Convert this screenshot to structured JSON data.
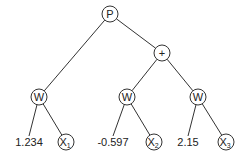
{
  "diagram": {
    "type": "expression-tree",
    "nodes": [
      {
        "id": "p",
        "label": "P",
        "sub": "",
        "x": 110,
        "y": 14
      },
      {
        "id": "plus",
        "label": "+",
        "sub": "",
        "x": 162,
        "y": 53
      },
      {
        "id": "w1",
        "label": "W",
        "sub": "",
        "x": 39,
        "y": 97
      },
      {
        "id": "w2",
        "label": "W",
        "sub": "",
        "x": 127,
        "y": 97
      },
      {
        "id": "w3",
        "label": "W",
        "sub": "",
        "x": 198,
        "y": 97
      },
      {
        "id": "x1",
        "label": "X",
        "sub": "1",
        "x": 66,
        "y": 142
      },
      {
        "id": "x2",
        "label": "X",
        "sub": "2",
        "x": 154,
        "y": 142
      },
      {
        "id": "x3",
        "label": "X",
        "sub": "3",
        "x": 226,
        "y": 142
      }
    ],
    "numbers": [
      {
        "id": "n1",
        "value": "1.234",
        "x": 29,
        "y": 142
      },
      {
        "id": "n2",
        "value": "-0.597",
        "x": 113,
        "y": 142
      },
      {
        "id": "n3",
        "value": "2.15",
        "x": 188,
        "y": 142
      }
    ],
    "edges": [
      [
        "p",
        "w1"
      ],
      [
        "p",
        "plus"
      ],
      [
        "plus",
        "w2"
      ],
      [
        "plus",
        "w3"
      ],
      [
        "w1",
        "n1"
      ],
      [
        "w1",
        "x1"
      ],
      [
        "w2",
        "n2"
      ],
      [
        "w2",
        "x2"
      ],
      [
        "w3",
        "n3"
      ],
      [
        "w3",
        "x3"
      ]
    ]
  }
}
